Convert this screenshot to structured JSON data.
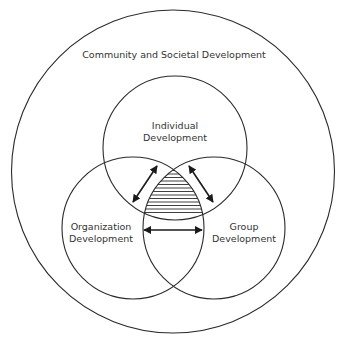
{
  "diagram": {
    "type": "nested-venn",
    "outer": {
      "label": "Community and Societal Development"
    },
    "circles": [
      {
        "id": "individual",
        "label_line1": "Individual",
        "label_line2": "Development"
      },
      {
        "id": "organization",
        "label_line1": "Organization",
        "label_line2": "Development"
      },
      {
        "id": "group",
        "label_line1": "Group",
        "label_line2": "Development"
      }
    ],
    "relations": [
      {
        "from": "organization",
        "to": "individual",
        "style": "double-arrow"
      },
      {
        "from": "individual",
        "to": "group",
        "style": "double-arrow"
      },
      {
        "from": "organization",
        "to": "group",
        "style": "double-arrow"
      }
    ],
    "center_region": {
      "style": "horizontal-hatch"
    },
    "colors": {
      "stroke": "#2a2a2a",
      "text": "#333333",
      "background": "#ffffff"
    }
  }
}
